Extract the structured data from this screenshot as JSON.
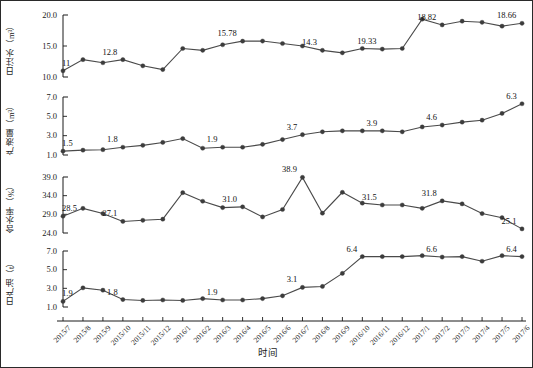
{
  "figure": {
    "x_axis_title": "时间",
    "x_categories": [
      "2015/7",
      "2015/8",
      "2015/9",
      "2015/10",
      "2015/11",
      "2015/12",
      "2016/1",
      "2016/2",
      "2016/3",
      "2016/4",
      "2016/5",
      "2016/6",
      "2016/7",
      "2016/8",
      "2016/9",
      "2016/10",
      "2016/11",
      "2016/12",
      "2017/1",
      "2017/2",
      "2017/3",
      "2017/4",
      "2017/5",
      "2017/6"
    ],
    "panels": [
      {
        "id": "daily-water-injection",
        "ylabel": "日注水（m³）",
        "yticks": [
          "20.0",
          "15.0",
          "10.0"
        ],
        "ylim": [
          10.0,
          20.0
        ],
        "annotations": [
          {
            "index": 0,
            "text": "11"
          },
          {
            "index": 3,
            "text": "12.8"
          },
          {
            "index": 9,
            "text": "15.78"
          },
          {
            "index": 13,
            "text": "14.3"
          },
          {
            "index": 16,
            "text": "19.33"
          },
          {
            "index": 19,
            "text": "18.82"
          },
          {
            "index": 23,
            "text": "18.66"
          }
        ]
      },
      {
        "id": "liquid-production",
        "ylabel": "产液量（m³）",
        "yticks": [
          "7.0",
          "5.0",
          "3.0",
          "1.0"
        ],
        "ylim": [
          1.0,
          7.0
        ],
        "annotations": [
          {
            "index": 0,
            "text": "1.5"
          },
          {
            "index": 3,
            "text": "1.8"
          },
          {
            "index": 8,
            "text": "1.9"
          },
          {
            "index": 12,
            "text": "3.7"
          },
          {
            "index": 16,
            "text": "3.9"
          },
          {
            "index": 19,
            "text": "4.6"
          },
          {
            "index": 23,
            "text": "6.3"
          }
        ]
      },
      {
        "id": "water-cut",
        "ylabel": "含水率（%）",
        "yticks": [
          "39.0",
          "34.0",
          "29.0",
          "24.0"
        ],
        "ylim": [
          24.0,
          39.0
        ],
        "annotations": [
          {
            "index": 0,
            "text": "28.5"
          },
          {
            "index": 3,
            "text": "27.1"
          },
          {
            "index": 9,
            "text": "31.0"
          },
          {
            "index": 12,
            "text": "38.9"
          },
          {
            "index": 16,
            "text": "31.5"
          },
          {
            "index": 19,
            "text": "31.8"
          },
          {
            "index": 23,
            "text": "25.1"
          }
        ]
      },
      {
        "id": "daily-oil-production",
        "ylabel": "日产油（t）",
        "yticks": [
          "7.0",
          "5.0",
          "3.0",
          "1.0"
        ],
        "ylim": [
          1.0,
          7.0
        ],
        "annotations": [
          {
            "index": 0,
            "text": "1.9"
          },
          {
            "index": 3,
            "text": "1.8"
          },
          {
            "index": 8,
            "text": "1.9"
          },
          {
            "index": 12,
            "text": "3.1"
          },
          {
            "index": 15,
            "text": "6.4"
          },
          {
            "index": 19,
            "text": "6.6"
          },
          {
            "index": 23,
            "text": "6.4"
          }
        ]
      }
    ]
  },
  "chart_data": [
    {
      "type": "line",
      "title": "日注水（m³）",
      "xlabel": "时间",
      "ylabel": "日注水（m³）",
      "ylim": [
        10.0,
        20.0
      ],
      "grid": false,
      "legend": "none",
      "categories": [
        "2015/7",
        "2015/8",
        "2015/9",
        "2015/10",
        "2015/11",
        "2015/12",
        "2016/1",
        "2016/2",
        "2016/3",
        "2016/4",
        "2016/5",
        "2016/6",
        "2016/7",
        "2016/8",
        "2016/9",
        "2016/10",
        "2016/11",
        "2016/12",
        "2017/1",
        "2017/2",
        "2017/3",
        "2017/4",
        "2017/5",
        "2017/6"
      ],
      "values": [
        11.0,
        12.8,
        12.3,
        12.8,
        11.8,
        11.2,
        14.6,
        14.3,
        15.2,
        15.78,
        15.8,
        15.4,
        15.0,
        14.3,
        13.9,
        14.6,
        14.5,
        14.6,
        19.33,
        18.4,
        19.0,
        18.82,
        18.2,
        18.66
      ]
    },
    {
      "type": "line",
      "title": "产液量（m³）",
      "xlabel": "时间",
      "ylabel": "产液量（m³）",
      "ylim": [
        1.0,
        7.0
      ],
      "grid": false,
      "legend": "none",
      "categories": [
        "2015/7",
        "2015/8",
        "2015/9",
        "2015/10",
        "2015/11",
        "2015/12",
        "2016/1",
        "2016/2",
        "2016/3",
        "2016/4",
        "2016/5",
        "2016/6",
        "2016/7",
        "2016/8",
        "2016/9",
        "2016/10",
        "2016/11",
        "2016/12",
        "2017/1",
        "2017/2",
        "2017/3",
        "2017/4",
        "2017/5",
        "2017/6"
      ],
      "values": [
        1.4,
        1.5,
        1.55,
        1.8,
        2.0,
        2.3,
        2.7,
        1.7,
        1.8,
        1.8,
        2.1,
        2.6,
        3.1,
        3.4,
        3.5,
        3.5,
        3.5,
        3.4,
        3.9,
        4.1,
        4.4,
        4.6,
        5.3,
        6.3
      ]
    },
    {
      "type": "line",
      "title": "含水率（%）",
      "xlabel": "时间",
      "ylabel": "含水率（%）",
      "ylim": [
        24.0,
        39.0
      ],
      "grid": false,
      "legend": "none",
      "categories": [
        "2015/7",
        "2015/8",
        "2015/9",
        "2015/10",
        "2015/11",
        "2015/12",
        "2016/1",
        "2016/2",
        "2016/3",
        "2016/4",
        "2016/5",
        "2016/6",
        "2016/7",
        "2016/8",
        "2016/9",
        "2016/10",
        "2016/11",
        "2016/12",
        "2017/1",
        "2017/2",
        "2017/3",
        "2017/4",
        "2017/5",
        "2017/6"
      ],
      "values": [
        28.5,
        30.6,
        29.2,
        27.1,
        27.4,
        27.7,
        34.8,
        32.5,
        30.8,
        31.0,
        28.3,
        30.3,
        38.9,
        29.3,
        34.9,
        32.0,
        31.5,
        31.5,
        30.6,
        32.6,
        31.8,
        29.2,
        28.1,
        25.1
      ]
    },
    {
      "type": "line",
      "title": "日产油（t）",
      "xlabel": "时间",
      "ylabel": "日产油（t）",
      "ylim": [
        1.0,
        7.0
      ],
      "grid": false,
      "legend": "none",
      "categories": [
        "2015/7",
        "2015/8",
        "2015/9",
        "2015/10",
        "2015/11",
        "2015/12",
        "2016/1",
        "2016/2",
        "2016/3",
        "2016/4",
        "2016/5",
        "2016/6",
        "2016/7",
        "2016/8",
        "2016/9",
        "2016/10",
        "2016/11",
        "2016/12",
        "2017/1",
        "2017/2",
        "2017/3",
        "2017/4",
        "2017/5",
        "2017/6"
      ],
      "values": [
        1.6,
        3.05,
        2.8,
        1.8,
        1.7,
        1.75,
        1.7,
        1.9,
        1.75,
        1.75,
        1.9,
        2.2,
        3.1,
        3.2,
        4.6,
        6.4,
        6.4,
        6.4,
        6.5,
        6.35,
        6.4,
        5.9,
        6.5,
        6.4
      ]
    }
  ]
}
